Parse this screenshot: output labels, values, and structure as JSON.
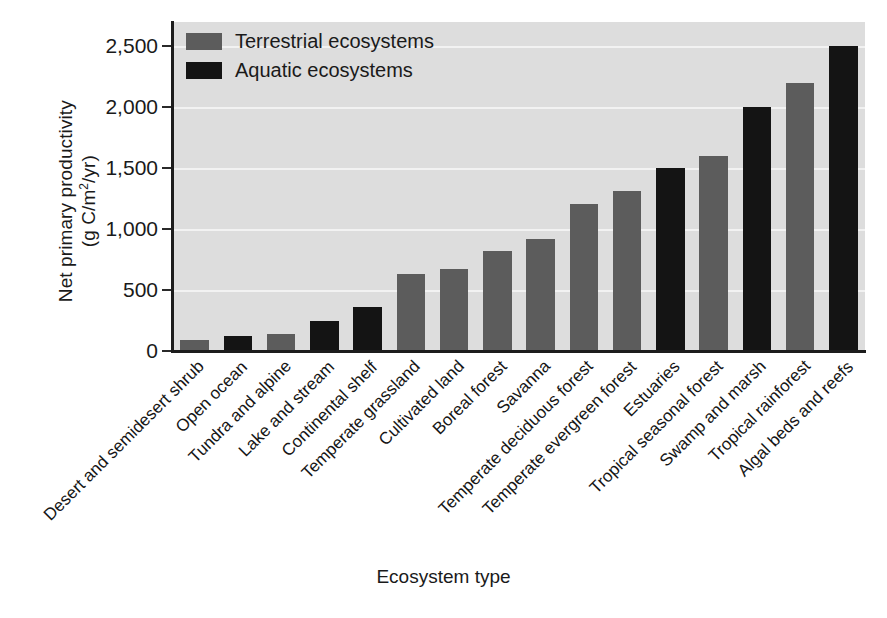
{
  "chart_data": {
    "type": "bar",
    "title": "",
    "xlabel": "Ecosystem type",
    "ylabel": "Net primary productivity (g C/m2/yr)",
    "ylabel_line1": "Net primary productivity",
    "ylabel_line2_prefix": "(g C/m",
    "ylabel_line2_sup": "2",
    "ylabel_line2_suffix": "/yr)",
    "ylim": [
      0,
      2700
    ],
    "yticks": [
      0,
      500,
      1000,
      1500,
      2000,
      2500
    ],
    "ytick_labels": [
      "0",
      "500",
      "1,000",
      "1,500",
      "2,000",
      "2,500"
    ],
    "grid": "horizontal",
    "legend_position": "top-left",
    "plot_background": "#dddddd",
    "categories": [
      "Desert and semidesert shrub",
      "Open ocean",
      "Tundra and alpine",
      "Lake and stream",
      "Continental shelf",
      "Temperate grassland",
      "Cultivated land",
      "Boreal forest",
      "Savanna",
      "Temperate deciduous forest",
      "Temperate evergreen forest",
      "Estuaries",
      "Tropical seasonal forest",
      "Swamp and marsh",
      "Tropical rainforest",
      "Algal beds and reefs"
    ],
    "values": [
      90,
      125,
      140,
      250,
      360,
      630,
      670,
      820,
      920,
      1210,
      1310,
      1500,
      1600,
      2000,
      2200,
      2500
    ],
    "groups": [
      "terrestrial",
      "aquatic",
      "terrestrial",
      "aquatic",
      "aquatic",
      "terrestrial",
      "terrestrial",
      "terrestrial",
      "terrestrial",
      "terrestrial",
      "terrestrial",
      "aquatic",
      "terrestrial",
      "aquatic",
      "terrestrial",
      "aquatic"
    ],
    "legend": [
      {
        "key": "terrestrial",
        "label": "Terrestrial ecosystems",
        "color": "#5c5c5c"
      },
      {
        "key": "aquatic",
        "label": "Aquatic ecosystems",
        "color": "#141414"
      }
    ]
  }
}
